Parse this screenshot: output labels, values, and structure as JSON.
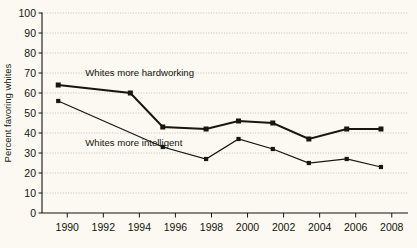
{
  "chart_data": {
    "type": "line",
    "title": "",
    "subtitle": "",
    "xlabel": "",
    "ylabel": "Percent favoring whites",
    "xlim": [
      1988.6,
      2008.9
    ],
    "ylim": [
      0,
      100
    ],
    "grid": "horizontal-dotted",
    "legend": "none-inline-annotations",
    "background_color": "#fbf9f1",
    "line_color": "#17170f",
    "ytick_labels": [
      "0",
      "10",
      "20",
      "30",
      "40",
      "50",
      "60",
      "70",
      "80",
      "90",
      "100"
    ],
    "ytick_values": [
      0,
      10,
      20,
      30,
      40,
      50,
      60,
      70,
      80,
      90,
      100
    ],
    "xtick_labels": [
      "1990",
      "1992",
      "1994",
      "1996",
      "1998",
      "2000",
      "2002",
      "2004",
      "2006",
      "2008"
    ],
    "xtick_values": [
      1990,
      1992,
      1994,
      1996,
      1998,
      2000,
      2002,
      2004,
      2006,
      2008
    ],
    "series": [
      {
        "name": "Whites more hardworking",
        "marker": "square",
        "line_width": "thick",
        "x": [
          1989.5,
          1993.5,
          1995.3,
          1997.7,
          1999.5,
          2001.4,
          2003.4,
          2005.5,
          2007.4
        ],
        "values": [
          64,
          60,
          43,
          42,
          46,
          45,
          37,
          42,
          42
        ]
      },
      {
        "name": "Whites more intelligent",
        "marker": "square",
        "line_width": "thin",
        "x": [
          1989.5,
          1995.3,
          1997.7,
          1999.5,
          2001.4,
          2003.4,
          2005.5,
          2007.4
        ],
        "values": [
          56,
          33,
          27,
          37,
          32,
          25,
          27,
          23
        ]
      }
    ],
    "annotations": [
      {
        "text": "Whites more hardworking",
        "x": 1991.0,
        "y": 68.5
      },
      {
        "text": "Whites more intelligent",
        "x": 1991.0,
        "y": 33.5
      }
    ]
  }
}
